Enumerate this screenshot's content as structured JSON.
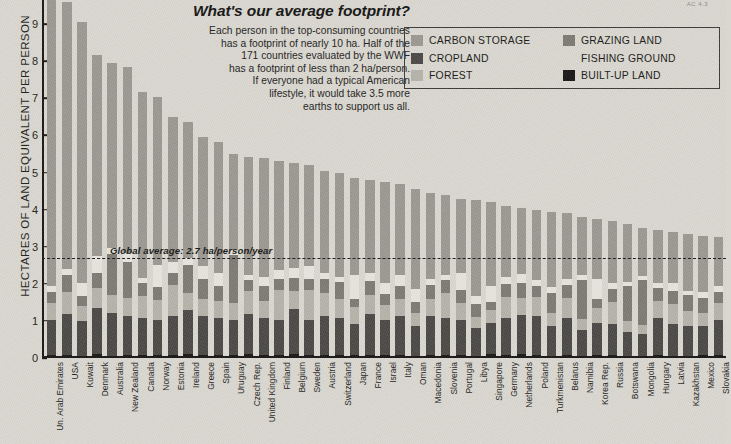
{
  "annotation": {
    "title": "What's our average footprint?",
    "lines": [
      "Each person in the top-consuming countries",
      "has a footprint of nearly 10 ha. Half of the",
      "171 countries evaluated by the WWF",
      "has a footprint of less than 2 ha/person.",
      "If everyone had a typical American",
      "lifestyle, it would take 3.5 more",
      "earths to support us all."
    ]
  },
  "corner_mark": "AC 4.3",
  "legend": {
    "column1": [
      {
        "label": "CARBON STORAGE",
        "color": "#9a9890"
      },
      {
        "label": "CROPLAND",
        "color": "#4a4845"
      },
      {
        "label": "FOREST",
        "color": "#b4b2a9"
      }
    ],
    "column2": [
      {
        "label": "GRAZING LAND",
        "color": "#7c7a72"
      },
      {
        "label": "FISHING GROUND",
        "color": "#e6e4dc"
      },
      {
        "label": "BUILT-UP LAND",
        "color": "#171614"
      }
    ]
  },
  "average_line": {
    "label": "Global average: 2.7 ha/person/year",
    "value": 2.7
  },
  "chart_data": {
    "type": "bar",
    "stacked": true,
    "title": "What's our average footprint?",
    "xlabel": "",
    "ylabel": "HECTARES OF LAND EQUIVALENT PER PERSON",
    "ylim": [
      0,
      9.65
    ],
    "yticks": [
      0,
      1,
      2,
      3,
      4,
      5,
      6,
      7,
      8,
      9
    ],
    "grid": false,
    "legend_position": "top-right",
    "annotations": [
      {
        "type": "hline",
        "value": 2.7,
        "label": "Global average: 2.7 ha/person/year",
        "style": "dashed"
      }
    ],
    "series_order": [
      "BUILT-UP LAND",
      "CROPLAND",
      "FOREST",
      "GRAZING LAND",
      "FISHING GROUND",
      "CARBON STORAGE"
    ],
    "series_colors": {
      "BUILT-UP LAND": "#171614",
      "CROPLAND": "#4a4845",
      "FOREST": "#b4b2a9",
      "GRAZING LAND": "#7c7a72",
      "FISHING GROUND": "#e6e4dc",
      "CARBON STORAGE": "#9a9890"
    },
    "categories": [
      "Un. Arab Emirates",
      "USA",
      "Kuwait",
      "Denmark",
      "Australia",
      "New Zealand",
      "Canada",
      "Norway",
      "Estonia",
      "Ireland",
      "Greece",
      "Spain",
      "Uruguay",
      "Czech Rep.",
      "United Kingdom",
      "Finland",
      "Belgium",
      "Sweden",
      "Austria",
      "Switzerland",
      "Japan",
      "France",
      "Israel",
      "Italy",
      "Oman",
      "Macedonia",
      "Slovenia",
      "Portugal",
      "Libya",
      "Singapore",
      "Germany",
      "Netherlands",
      "Poland",
      "Turkmenistan",
      "Belarus",
      "Namibia",
      "Korea Rep.",
      "Russia",
      "Botswana",
      "Mongolia",
      "Hungary",
      "Latvia",
      "Kazakhstan",
      "Mexico",
      "Slovakia"
    ],
    "totals": [
      10.7,
      9.6,
      9.05,
      8.18,
      7.95,
      7.85,
      7.18,
      7.05,
      6.5,
      6.35,
      5.95,
      5.82,
      5.5,
      5.42,
      5.4,
      5.3,
      5.25,
      5.2,
      5.05,
      5.0,
      4.85,
      4.8,
      4.75,
      4.7,
      4.55,
      4.45,
      4.4,
      4.3,
      4.25,
      4.2,
      4.1,
      4.05,
      4.0,
      3.95,
      3.9,
      3.8,
      3.75,
      3.7,
      3.6,
      3.5,
      3.45,
      3.4,
      3.35,
      3.3,
      3.25
    ],
    "series": [
      {
        "name": "BUILT-UP LAND",
        "values": [
          0.08,
          0.09,
          0.06,
          0.1,
          0.06,
          0.08,
          0.07,
          0.07,
          0.08,
          0.1,
          0.08,
          0.09,
          0.07,
          0.1,
          0.09,
          0.08,
          0.12,
          0.08,
          0.09,
          0.09,
          0.08,
          0.09,
          0.08,
          0.09,
          0.06,
          0.08,
          0.09,
          0.08,
          0.06,
          0.1,
          0.09,
          0.11,
          0.09,
          0.06,
          0.08,
          0.05,
          0.09,
          0.07,
          0.05,
          0.05,
          0.08,
          0.06,
          0.06,
          0.07,
          0.08
        ]
      },
      {
        "name": "CROPLAND",
        "values": [
          0.95,
          1.1,
          0.95,
          1.25,
          1.15,
          1.05,
          1.0,
          0.95,
          1.05,
          1.2,
          1.05,
          1.0,
          0.95,
          1.1,
          1.0,
          0.95,
          1.2,
          0.95,
          1.05,
          1.0,
          0.85,
          1.1,
          0.95,
          1.05,
          0.8,
          1.05,
          1.0,
          0.95,
          0.75,
          0.85,
          1.0,
          1.05,
          1.05,
          0.8,
          1.0,
          0.7,
          0.85,
          0.85,
          0.65,
          0.6,
          1.0,
          0.85,
          0.8,
          0.8,
          0.95
        ]
      },
      {
        "name": "FOREST",
        "values": [
          0.45,
          0.6,
          0.4,
          0.55,
          0.5,
          0.5,
          0.6,
          0.55,
          0.85,
          0.45,
          0.45,
          0.45,
          0.45,
          0.6,
          0.45,
          0.8,
          0.5,
          0.8,
          0.6,
          0.5,
          0.45,
          0.5,
          0.4,
          0.45,
          0.35,
          0.45,
          0.65,
          0.45,
          0.3,
          0.35,
          0.55,
          0.45,
          0.5,
          0.35,
          0.55,
          0.3,
          0.4,
          0.6,
          0.3,
          0.25,
          0.45,
          0.55,
          0.4,
          0.35,
          0.45
        ]
      },
      {
        "name": "GRAZING LAND",
        "values": [
          0.3,
          0.45,
          0.25,
          0.4,
          1.1,
          0.95,
          0.35,
          0.35,
          0.3,
          0.75,
          0.55,
          0.4,
          1.3,
          0.3,
          0.4,
          0.3,
          0.35,
          0.3,
          0.4,
          0.45,
          0.2,
          0.4,
          0.3,
          0.35,
          0.3,
          0.4,
          0.35,
          0.35,
          0.35,
          0.2,
          0.35,
          0.4,
          0.3,
          0.55,
          0.35,
          1.05,
          0.25,
          0.35,
          0.95,
          1.2,
          0.35,
          0.35,
          0.45,
          0.4,
          0.3
        ]
      },
      {
        "name": "FISHING GROUND",
        "values": [
          0.15,
          0.15,
          0.35,
          0.45,
          0.15,
          0.25,
          0.15,
          0.6,
          0.3,
          0.2,
          0.35,
          0.35,
          0.15,
          0.15,
          0.25,
          0.25,
          0.25,
          0.35,
          0.15,
          0.15,
          0.65,
          0.2,
          0.3,
          0.3,
          0.35,
          0.15,
          0.15,
          0.45,
          0.2,
          0.45,
          0.2,
          0.25,
          0.15,
          0.15,
          0.15,
          0.15,
          0.55,
          0.15,
          0.1,
          0.1,
          0.15,
          0.2,
          0.1,
          0.15,
          0.15
        ]
      },
      {
        "name": "CARBON STORAGE",
        "values": [
          8.77,
          7.21,
          7.04,
          5.43,
          4.99,
          5.02,
          5.01,
          4.53,
          3.92,
          3.65,
          3.47,
          3.53,
          2.58,
          3.17,
          3.21,
          2.92,
          2.83,
          2.72,
          2.76,
          2.81,
          2.62,
          2.51,
          2.72,
          2.46,
          2.69,
          2.32,
          2.16,
          2.02,
          2.59,
          2.25,
          1.91,
          1.79,
          1.91,
          2.04,
          1.77,
          1.55,
          1.61,
          1.68,
          1.55,
          1.3,
          1.42,
          1.39,
          1.54,
          1.53,
          1.32
        ]
      }
    ]
  }
}
